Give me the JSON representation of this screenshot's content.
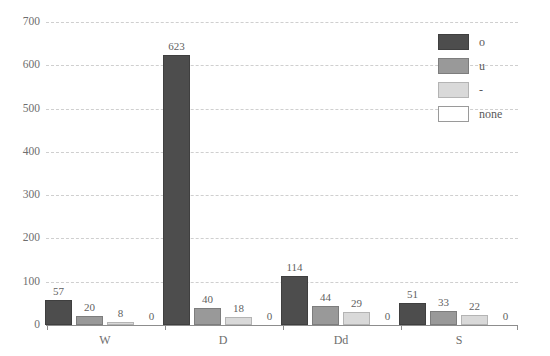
{
  "chart_data": {
    "type": "bar",
    "title": "",
    "xlabel": "",
    "ylabel": "",
    "ylim": [
      0,
      700
    ],
    "yticks": [
      0,
      100,
      200,
      300,
      400,
      500,
      600,
      700
    ],
    "grid": true,
    "legend_position": "top-right",
    "categories": [
      "W",
      "D",
      "Dd",
      "S"
    ],
    "series": [
      {
        "name": "o",
        "color": "#4d4d4d",
        "values": [
          57,
          623,
          114,
          51
        ]
      },
      {
        "name": "u",
        "color": "#999999",
        "values": [
          20,
          40,
          44,
          33
        ]
      },
      {
        "name": "-",
        "color": "#d9d9d9",
        "values": [
          8,
          18,
          29,
          22
        ]
      },
      {
        "name": "none",
        "color": "#ffffff",
        "values": [
          0,
          0,
          0,
          0
        ]
      }
    ]
  },
  "axis": {
    "y_tick_labels": [
      "0",
      "100",
      "200",
      "300",
      "400",
      "500",
      "600",
      "700"
    ],
    "x_tick_labels": [
      "W",
      "D",
      "Dd",
      "S"
    ]
  },
  "legend": {
    "entries": [
      {
        "label": "o"
      },
      {
        "label": "u"
      },
      {
        "label": "-"
      },
      {
        "label": "none"
      }
    ]
  }
}
